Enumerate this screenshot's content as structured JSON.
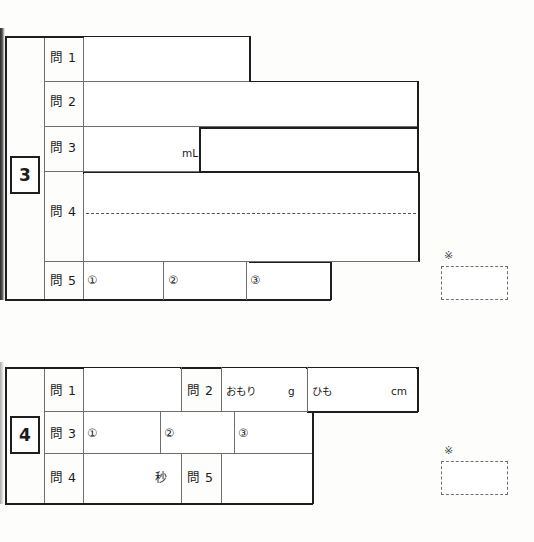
{
  "sheet": {
    "type": "japanese-exam-answer-sheet",
    "background_color": "#fdfdfc",
    "rule_color": "#2b2b2b"
  },
  "sections": [
    {
      "id": "section-3",
      "badge": "3",
      "rows": [
        {
          "id": "row-3-q1",
          "label": "問 1",
          "answer_cells": [
            {
              "unit": ""
            }
          ]
        },
        {
          "id": "row-3-q2",
          "label": "問 2",
          "answer_cells": [
            {
              "unit": ""
            }
          ]
        },
        {
          "id": "row-3-q3",
          "label": "問 3",
          "answer_cells": [
            {
              "unit": "mL"
            },
            {
              "unit": ""
            }
          ]
        },
        {
          "id": "row-3-q4",
          "label": "問 4",
          "answer_cells": [
            {
              "unit": ""
            }
          ],
          "has_dotted_writing_line": true
        },
        {
          "id": "row-3-q5",
          "label": "問 5",
          "answer_cells": [
            {
              "subnum": "①"
            },
            {
              "subnum": "②"
            },
            {
              "subnum": "③"
            }
          ]
        }
      ],
      "score_marker": {
        "star": "※",
        "value": ""
      }
    },
    {
      "id": "section-4",
      "badge": "4",
      "rows": [
        {
          "id": "row-4-q1",
          "label": "問 1",
          "answer_cells": [
            {
              "unit": ""
            }
          ]
        },
        {
          "id": "row-4-q2",
          "label": "問 2",
          "answer_cells": [
            {
              "prefix": "おもり",
              "unit": "g"
            },
            {
              "prefix": "ひも",
              "unit": "cm"
            }
          ]
        },
        {
          "id": "row-4-q3",
          "label": "問 3",
          "answer_cells": [
            {
              "subnum": "①"
            },
            {
              "subnum": "②"
            },
            {
              "subnum": "③"
            }
          ]
        },
        {
          "id": "row-4-q4",
          "label": "問 4",
          "answer_cells": [
            {
              "unit": "秒"
            }
          ]
        },
        {
          "id": "row-4-q5",
          "label": "問 5",
          "answer_cells": [
            {
              "unit": ""
            }
          ]
        }
      ],
      "score_marker": {
        "star": "※",
        "value": ""
      }
    }
  ]
}
